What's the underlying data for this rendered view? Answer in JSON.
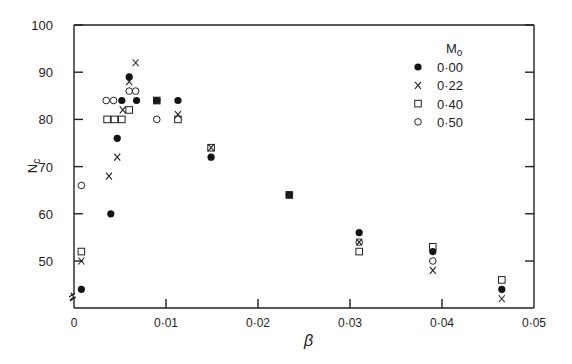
{
  "chart_data": {
    "type": "scatter",
    "title": "",
    "xlabel": "β",
    "ylabel": "N_c",
    "xlim": [
      0,
      0.05
    ],
    "ylim": [
      42,
      100
    ],
    "axis_break": "y-axis broken below 50",
    "grid": false,
    "legend_position": "upper right inside",
    "legend_title": "M₀",
    "x_ticks": [
      0,
      0.01,
      0.02,
      0.03,
      0.04,
      0.05
    ],
    "x_tick_labels": [
      "0",
      "0·01",
      "0·02",
      "0·03",
      "0·04",
      "0·05"
    ],
    "y_ticks": [
      50,
      60,
      70,
      80,
      90,
      100
    ],
    "y_tick_labels": [
      "50",
      "60",
      "70",
      "80",
      "90",
      "100"
    ],
    "series": [
      {
        "name": "0·00",
        "marker": "filled-circle",
        "points": [
          [
            0.0008,
            44
          ],
          [
            0.004,
            60
          ],
          [
            0.0047,
            76
          ],
          [
            0.0052,
            84
          ],
          [
            0.006,
            89
          ],
          [
            0.0068,
            84
          ],
          [
            0.009,
            84
          ],
          [
            0.0113,
            84
          ],
          [
            0.0149,
            72
          ],
          [
            0.0234,
            64
          ],
          [
            0.031,
            56
          ],
          [
            0.039,
            52
          ],
          [
            0.0465,
            44
          ]
        ]
      },
      {
        "name": "0·22",
        "marker": "cross",
        "points": [
          [
            0.0008,
            50
          ],
          [
            0.0038,
            68
          ],
          [
            0.0047,
            72
          ],
          [
            0.0053,
            82
          ],
          [
            0.006,
            88
          ],
          [
            0.0067,
            92
          ],
          [
            0.009,
            84
          ],
          [
            0.0113,
            81
          ],
          [
            0.0149,
            74
          ],
          [
            0.0234,
            64
          ],
          [
            0.031,
            54
          ],
          [
            0.039,
            48
          ],
          [
            0.0465,
            42
          ]
        ]
      },
      {
        "name": "0·40",
        "marker": "open-square",
        "points": [
          [
            0.0008,
            52
          ],
          [
            0.0036,
            80
          ],
          [
            0.0044,
            80
          ],
          [
            0.0052,
            80
          ],
          [
            0.006,
            82
          ],
          [
            0.009,
            84
          ],
          [
            0.0113,
            80
          ],
          [
            0.0149,
            74
          ],
          [
            0.0234,
            64
          ],
          [
            0.031,
            52
          ],
          [
            0.039,
            53
          ],
          [
            0.0465,
            46
          ]
        ]
      },
      {
        "name": "0·50",
        "marker": "open-circle",
        "points": [
          [
            0.0008,
            66
          ],
          [
            0.0035,
            84
          ],
          [
            0.0043,
            84
          ],
          [
            0.006,
            86
          ],
          [
            0.0067,
            86
          ],
          [
            0.009,
            80
          ],
          [
            0.031,
            54
          ],
          [
            0.039,
            50
          ]
        ]
      }
    ]
  }
}
